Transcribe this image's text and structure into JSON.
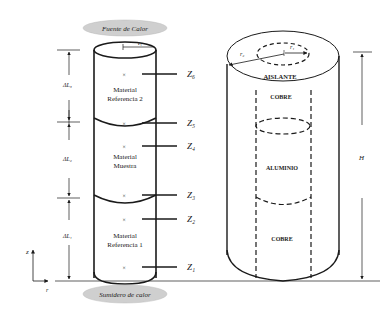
{
  "left_diagram": {
    "heat_source": "Fuente de Calor",
    "heat_sink": "Sumidero de calor",
    "radius_label": "r₁",
    "sections": [
      {
        "material": "Material",
        "name": "Referencia 2",
        "length": "ΔL₃"
      },
      {
        "material": "Material",
        "name": "Muestra",
        "length": "ΔL₂"
      },
      {
        "material": "Material",
        "name": "Referencia 1",
        "length": "ΔL₁"
      }
    ],
    "thermocouple_mark": "×",
    "z_labels": [
      "Z₆",
      "Z₅",
      "Z₄",
      "Z₃",
      "Z₂",
      "Z₁"
    ],
    "axis_z": "z",
    "axis_r": "r"
  },
  "right_diagram": {
    "outer_radius": "r₂",
    "inner_radius": "r₁",
    "insulation": "AISLANTE",
    "layers": [
      "COBRE",
      "ALUMINIO",
      "COBRE"
    ],
    "height": "H"
  },
  "colors": {
    "line": "#1a1a1a",
    "ellipse_fill": "#cfcfcf"
  }
}
